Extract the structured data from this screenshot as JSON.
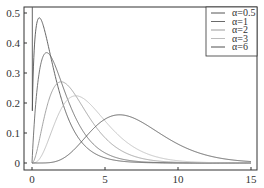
{
  "chart_data": {
    "type": "line",
    "title": "",
    "xlabel": "",
    "ylabel": "",
    "xlim": [
      -0.5,
      15.5
    ],
    "ylim": [
      -0.02,
      0.52
    ],
    "x_ticks": [
      "0",
      "5",
      "10",
      "15"
    ],
    "y_ticks": [
      "0",
      "0.1",
      "0.2",
      "0.3",
      "0.4",
      "0.5"
    ],
    "grid": false,
    "legend_position": "upper right",
    "formula": "x^alpha * exp(-x) / Gamma(alpha+1)",
    "series": [
      {
        "name": "α=0.5",
        "alpha": 0.5,
        "color": "#555555",
        "peak": {
          "x": 0.5,
          "y": 0.48
        }
      },
      {
        "name": "α=1",
        "alpha": 1,
        "color": "#6a6a6a",
        "peak": {
          "x": 1,
          "y": 0.37
        }
      },
      {
        "name": "α=2",
        "alpha": 2,
        "color": "#9a9a9a",
        "peak": {
          "x": 2,
          "y": 0.27
        }
      },
      {
        "name": "α=3",
        "alpha": 3,
        "color": "#bcbcbc",
        "peak": {
          "x": 3,
          "y": 0.22
        }
      },
      {
        "name": "α=6",
        "alpha": 6,
        "color": "#505050",
        "peak": {
          "x": 5,
          "y": 0.175
        }
      }
    ]
  }
}
